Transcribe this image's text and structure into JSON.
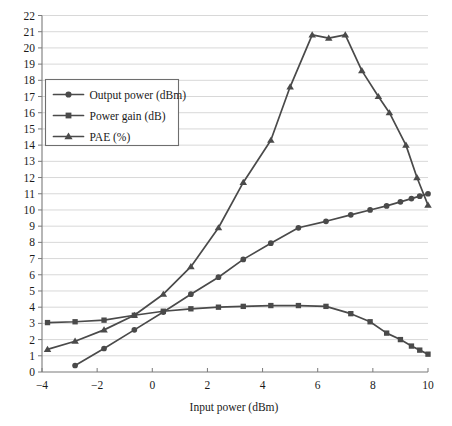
{
  "chart_data": {
    "type": "line",
    "title": "",
    "xlabel": "Input power (dBm)",
    "ylabel": "",
    "xlim": [
      -4,
      10
    ],
    "ylim": [
      0,
      22
    ],
    "xticks": [
      -4,
      -2,
      0,
      2,
      4,
      6,
      8,
      10
    ],
    "yticks": [
      0,
      1,
      2,
      3,
      4,
      5,
      6,
      7,
      8,
      9,
      10,
      11,
      12,
      13,
      14,
      15,
      16,
      17,
      18,
      19,
      20,
      21,
      22
    ],
    "xtick_labels": [
      "−4",
      "−2",
      "0",
      "2",
      "4",
      "6",
      "8",
      "10"
    ],
    "ytick_labels": [
      "0",
      "1",
      "2",
      "3",
      "4",
      "5",
      "6",
      "7",
      "8",
      "9",
      "10",
      "11",
      "12",
      "13",
      "14",
      "15",
      "16",
      "17",
      "18",
      "19",
      "20",
      "21",
      "22"
    ],
    "grid": true,
    "grid_axis": "y",
    "legend_position": "upper left",
    "line_color": "#4a4a4a",
    "grid_color": "#d8d8d8",
    "axis_color": "#7a7a7a",
    "series": [
      {
        "name": "Output power (dBm)",
        "marker": "circle",
        "x": [
          -2.8,
          -1.75,
          -0.65,
          0.4,
          1.4,
          2.4,
          3.3,
          4.3,
          5.3,
          6.3,
          7.2,
          7.9,
          8.5,
          9.0,
          9.4,
          9.7,
          10.0
        ],
        "y": [
          0.4,
          1.45,
          2.6,
          3.7,
          4.8,
          5.85,
          6.95,
          7.95,
          8.9,
          9.3,
          9.7,
          10.0,
          10.25,
          10.5,
          10.7,
          10.85,
          11.0
        ]
      },
      {
        "name": "Power gain (dB)",
        "marker": "square",
        "x": [
          -3.8,
          -2.8,
          -1.75,
          -0.65,
          0.4,
          1.4,
          2.4,
          3.3,
          4.3,
          5.3,
          6.3,
          7.2,
          7.9,
          8.5,
          9.0,
          9.4,
          9.7,
          10.0
        ],
        "y": [
          3.05,
          3.1,
          3.2,
          3.5,
          3.75,
          3.9,
          4.0,
          4.05,
          4.1,
          4.1,
          4.05,
          3.6,
          3.1,
          2.4,
          2.0,
          1.6,
          1.35,
          1.1
        ]
      },
      {
        "name": "PAE (%)",
        "marker": "triangle",
        "x": [
          -3.8,
          -2.8,
          -1.75,
          -0.65,
          0.4,
          1.4,
          2.4,
          3.3,
          4.3,
          5.0,
          5.8,
          6.4,
          7.0,
          7.6,
          8.2,
          8.6,
          9.2,
          9.6,
          10.0
        ],
        "y": [
          1.4,
          1.9,
          2.6,
          3.5,
          4.8,
          6.5,
          8.9,
          11.7,
          14.3,
          17.6,
          20.8,
          20.6,
          20.8,
          18.6,
          17.0,
          16.0,
          14.0,
          12.0,
          10.3
        ]
      }
    ]
  },
  "legend": {
    "items": [
      {
        "label": "Output power (dBm)",
        "marker": "circle"
      },
      {
        "label": "Power gain (dB)",
        "marker": "square"
      },
      {
        "label": "PAE (%)",
        "marker": "triangle"
      }
    ]
  }
}
